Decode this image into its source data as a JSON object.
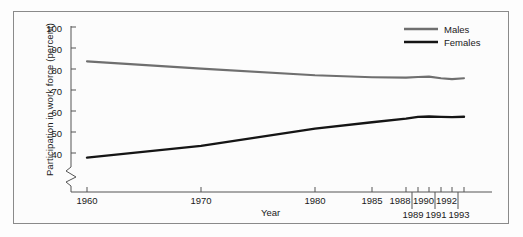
{
  "chart_data": {
    "type": "line",
    "title": "",
    "xlabel": "Year",
    "ylabel": "Participation in work force (percent)",
    "ylim": [
      35,
      102
    ],
    "yticks": [
      40,
      50,
      60,
      70,
      80,
      90,
      100
    ],
    "ytick_labels": [
      "40",
      "50",
      "60",
      "70",
      "80",
      "90",
      "100"
    ],
    "y_axis_break": true,
    "grid": false,
    "legend_position": "top-right",
    "xticks": [
      1960,
      1970,
      1980,
      1985,
      1988,
      1989,
      1990,
      1991,
      1992,
      1993
    ],
    "xtick_labels_upper": [
      "1960",
      "1970",
      "1980",
      "1985",
      "1988",
      "1990",
      "1992"
    ],
    "xtick_labels_lower": [
      "1989",
      "1991",
      "1993"
    ],
    "x": [
      1960,
      1970,
      1980,
      1985,
      1988,
      1989,
      1990,
      1991,
      1992,
      1993
    ],
    "series": [
      {
        "name": "Males",
        "color": "#6f6f6f",
        "values": [
          83.6,
          80.2,
          77.0,
          76.1,
          75.9,
          76.2,
          76.4,
          75.6,
          75.2,
          75.6
        ]
      },
      {
        "name": "Females",
        "color": "#151515",
        "values": [
          37.8,
          43.4,
          51.6,
          54.6,
          56.4,
          57.2,
          57.4,
          57.2,
          57.1,
          57.3
        ]
      }
    ]
  },
  "axis": {
    "ylabel": "Participation in work force (percent)",
    "xlabel": "Year",
    "ytick_100": "100",
    "ytick_90": "90",
    "ytick_80": "80",
    "ytick_70": "70",
    "ytick_60": "60",
    "ytick_50": "50",
    "ytick_40": "40",
    "xtick_1960": "1960",
    "xtick_1970": "1970",
    "xtick_1980": "1980",
    "xtick_1985": "1985",
    "xtick_1988": "1988",
    "xtick_1989": "1989",
    "xtick_1990": "1990",
    "xtick_1991": "1991",
    "xtick_1992": "1992",
    "xtick_1993": "1993"
  },
  "legend": {
    "males": "Males",
    "females": "Females",
    "males_color": "#6f6f6f",
    "females_color": "#151515"
  }
}
